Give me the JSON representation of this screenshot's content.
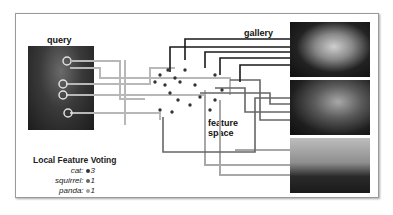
{
  "labels": {
    "query": "query",
    "gallery": "gallery",
    "feature_space_line1": "feature",
    "feature_space_line2": "space"
  },
  "voting": {
    "title": "Local Feature Voting",
    "entries": [
      {
        "label": "cat:",
        "count": "3",
        "dot_color": "#333333"
      },
      {
        "label": "squirrel:",
        "count": "1",
        "dot_color": "#666666"
      },
      {
        "label": "panda:",
        "count": "1",
        "dot_color": "#a0a0a0"
      }
    ]
  },
  "images": {
    "query": "superhero-costume-person",
    "gallery": [
      "cat",
      "squirrel",
      "panda"
    ]
  },
  "colors": {
    "cat_line": "#1a1a1a",
    "squirrel_line": "#555555",
    "panda_line": "#a8a8a8",
    "query_line": "#b8b8b8"
  }
}
